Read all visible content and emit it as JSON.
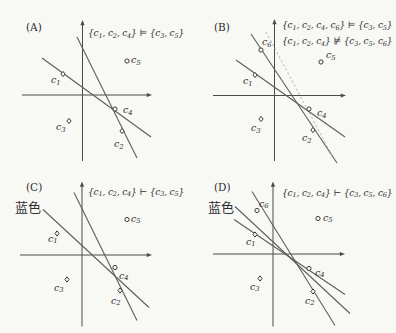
{
  "figure": {
    "width": 396,
    "height": 333,
    "colors": {
      "background": "#f8f8f5",
      "axis": "#4a4a4a",
      "line": "#5d5d5d",
      "dotted_line": "#a3a3a3",
      "text": "#2f2f2f",
      "marker_stroke": "#3d3d3d",
      "marker_fill": "#f8f8f5"
    },
    "panels": [
      {
        "id": "A",
        "tag": {
          "text": "(A)",
          "x": 26,
          "y": 31
        },
        "origin": {
          "x": 0,
          "y": 0
        },
        "formulas": [
          {
            "text": "{c_1, c_2, c_4} ⊨ {c_3, c_5}",
            "x": 88,
            "y": 36
          }
        ],
        "annotations": [],
        "axes": {
          "y_axis": {
            "x": 82.5,
            "top": 20,
            "bottom": 161
          },
          "x_axis": {
            "y": 95,
            "left": 22,
            "right": 152
          }
        },
        "lines": [
          {
            "x1": 42,
            "y1": 58,
            "x2": 151,
            "y2": 137,
            "style": "solid"
          },
          {
            "x1": 77,
            "y1": 37,
            "x2": 137,
            "y2": 158,
            "style": "solid"
          }
        ],
        "points": [
          {
            "id": "c1",
            "marker": "diamond",
            "x": 63,
            "y": 74,
            "label": "c_1",
            "lx": 51,
            "ly": 83
          },
          {
            "id": "c5",
            "marker": "circle",
            "x": 127,
            "y": 61,
            "label": "c_5",
            "lx": 131,
            "ly": 63
          },
          {
            "id": "c4",
            "marker": "circle",
            "x": 115,
            "y": 109,
            "label": "c_4",
            "lx": 123,
            "ly": 113
          },
          {
            "id": "c3",
            "marker": "diamond",
            "x": 69,
            "y": 121,
            "label": "c_3",
            "lx": 56,
            "ly": 130
          },
          {
            "id": "c2",
            "marker": "diamond",
            "x": 122,
            "y": 131,
            "label": "c_2",
            "lx": 114,
            "ly": 147
          }
        ]
      },
      {
        "id": "B",
        "tag": {
          "text": "(B)",
          "x": 16,
          "y": 31
        },
        "origin": {
          "x": 198,
          "y": 0
        },
        "formulas": [
          {
            "text": "{c_1, c_2, c_4, c_6} ⊨ {c_3, c_5}",
            "x": 84,
            "y": 28
          },
          {
            "text": "{c_1, c_2, c_4} ⊭ {c_3, c_5, c_6}",
            "x": 84,
            "y": 44
          }
        ],
        "annotations": [],
        "axes": {
          "y_axis": {
            "x": 76.5,
            "top": 19,
            "bottom": 161
          },
          "x_axis": {
            "y": 95.5,
            "left": 15,
            "right": 148
          }
        },
        "lines": [
          {
            "x1": 38,
            "y1": 60,
            "x2": 147,
            "y2": 137,
            "style": "solid"
          },
          {
            "x1": 53,
            "y1": 34,
            "x2": 139,
            "y2": 163,
            "style": "solid"
          },
          {
            "x1": 68,
            "y1": 32,
            "x2": 137,
            "y2": 161,
            "style": "dotted"
          }
        ],
        "points": [
          {
            "id": "c6",
            "marker": "circle",
            "x": 63,
            "y": 50,
            "label": "c_6",
            "lx": 64,
            "ly": 45
          },
          {
            "id": "c1",
            "marker": "diamond",
            "x": 57,
            "y": 75,
            "label": "c_1",
            "lx": 45,
            "ly": 84
          },
          {
            "id": "c5",
            "marker": "circle",
            "x": 123,
            "y": 62,
            "label": "c_5",
            "lx": 128,
            "ly": 58
          },
          {
            "id": "c4",
            "marker": "circle",
            "x": 111,
            "y": 109,
            "label": "c_4",
            "lx": 119,
            "ly": 116
          },
          {
            "id": "c3",
            "marker": "diamond",
            "x": 63,
            "y": 119,
            "label": "c_3",
            "lx": 53,
            "ly": 131
          },
          {
            "id": "c2",
            "marker": "diamond",
            "x": 115,
            "y": 130,
            "label": "c_2",
            "lx": 104,
            "ly": 141
          }
        ]
      },
      {
        "id": "C",
        "tag": {
          "text": "(C)",
          "x": 26,
          "y": 24
        },
        "origin": {
          "x": 0,
          "y": 166.5
        },
        "formulas": [
          {
            "text": "{c_1, c_2, c_4} ⊢ {c_3, c_5}",
            "x": 88,
            "y": 28
          }
        ],
        "annotations": [
          {
            "text": "蓝色",
            "x": 15,
            "y": 45
          }
        ],
        "axes": {
          "y_axis": {
            "x": 82,
            "top": 15,
            "bottom": 160
          },
          "x_axis": {
            "y": 88.5,
            "left": 20,
            "right": 152
          }
        },
        "lines": [
          {
            "x1": 43,
            "y1": 43,
            "x2": 149,
            "y2": 141,
            "style": "solid"
          },
          {
            "x1": 74,
            "y1": 26,
            "x2": 137,
            "y2": 154,
            "style": "solid"
          }
        ],
        "points": [
          {
            "id": "c1",
            "marker": "diamond",
            "x": 57,
            "y": 67,
            "label": "c_1",
            "lx": 48,
            "ly": 75
          },
          {
            "id": "c5",
            "marker": "circle",
            "x": 127,
            "y": 53,
            "label": "c_5",
            "lx": 131,
            "ly": 55
          },
          {
            "id": "c4",
            "marker": "circle",
            "x": 115,
            "y": 101,
            "label": "c_4",
            "lx": 119,
            "ly": 112
          },
          {
            "id": "c3",
            "marker": "diamond",
            "x": 67,
            "y": 113,
            "label": "c_3",
            "lx": 54,
            "ly": 124
          },
          {
            "id": "c2",
            "marker": "diamond",
            "x": 120,
            "y": 124,
            "label": "c_2",
            "lx": 111,
            "ly": 137
          }
        ]
      },
      {
        "id": "D",
        "tag": {
          "text": "(D)",
          "x": 16,
          "y": 24
        },
        "origin": {
          "x": 198,
          "y": 166.5
        },
        "formulas": [
          {
            "text": "{c_1, c_2, c_4} ⊢ {c_3, c_5, c_6}",
            "x": 84,
            "y": 29
          }
        ],
        "annotations": [
          {
            "text": "蓝色",
            "x": 10,
            "y": 45
          }
        ],
        "axes": {
          "y_axis": {
            "x": 75,
            "top": 15,
            "bottom": 160
          },
          "x_axis": {
            "y": 87.5,
            "left": 15,
            "right": 147
          }
        },
        "lines": [
          {
            "x1": 54,
            "y1": 25,
            "x2": 137,
            "y2": 159,
            "style": "solid"
          },
          {
            "x1": 37,
            "y1": 40,
            "x2": 152,
            "y2": 147,
            "style": "solid"
          },
          {
            "x1": 36,
            "y1": 53,
            "x2": 147,
            "y2": 128,
            "style": "solid"
          }
        ],
        "points": [
          {
            "id": "c6",
            "marker": "circle",
            "x": 59,
            "y": 44,
            "label": "c_6",
            "lx": 61,
            "ly": 40
          },
          {
            "id": "c1",
            "marker": "diamond",
            "x": 57,
            "y": 68,
            "label": "c_1",
            "lx": 48,
            "ly": 78
          },
          {
            "id": "c5",
            "marker": "circle",
            "x": 120,
            "y": 52,
            "label": "c_5",
            "lx": 125,
            "ly": 54
          },
          {
            "id": "c4",
            "marker": "circle",
            "x": 111,
            "y": 102,
            "label": "c_4",
            "lx": 117,
            "ly": 109
          },
          {
            "id": "c3",
            "marker": "diamond",
            "x": 62,
            "y": 112,
            "label": "c_3",
            "lx": 52,
            "ly": 123
          },
          {
            "id": "c2",
            "marker": "diamond",
            "x": 115,
            "y": 125,
            "label": "c_2",
            "lx": 107,
            "ly": 137
          }
        ]
      }
    ]
  }
}
